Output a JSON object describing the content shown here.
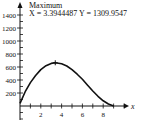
{
  "chart_data": {
    "type": "line",
    "title": "",
    "xlabel": "x",
    "ylabel": "",
    "xlim": [
      0,
      10
    ],
    "ylim": [
      0,
      1500
    ],
    "x_ticks": [
      2,
      4,
      6,
      8
    ],
    "y_ticks": [
      200,
      400,
      600,
      800,
      1000,
      1200,
      1400
    ],
    "x_tick_labels": [
      "2",
      "4",
      "6",
      "8"
    ],
    "y_tick_labels": [
      "200",
      "400",
      "600",
      "800",
      "1000",
      "1200",
      "1400"
    ],
    "grid": false,
    "series": [
      {
        "name": "curve",
        "x": [
          0,
          0.5,
          1,
          1.5,
          2,
          2.5,
          3,
          3.39,
          4,
          4.5,
          5,
          5.5,
          6,
          6.5,
          7,
          7.5,
          8,
          8.5,
          9
        ],
        "y": [
          40,
          220,
          360,
          470,
          560,
          620,
          655,
          665,
          650,
          615,
          560,
          490,
          410,
          320,
          230,
          150,
          80,
          30,
          0
        ]
      }
    ],
    "annotations": [
      {
        "label": "Maximum",
        "text": "X = 3.3944487 Y = 1309.9547",
        "x": 3.39,
        "y": 665
      }
    ]
  },
  "annotation": {
    "title": "Maximum",
    "coords": "X = 3.3944487 Y = 1309.9547"
  },
  "axis": {
    "x_label": "x"
  }
}
